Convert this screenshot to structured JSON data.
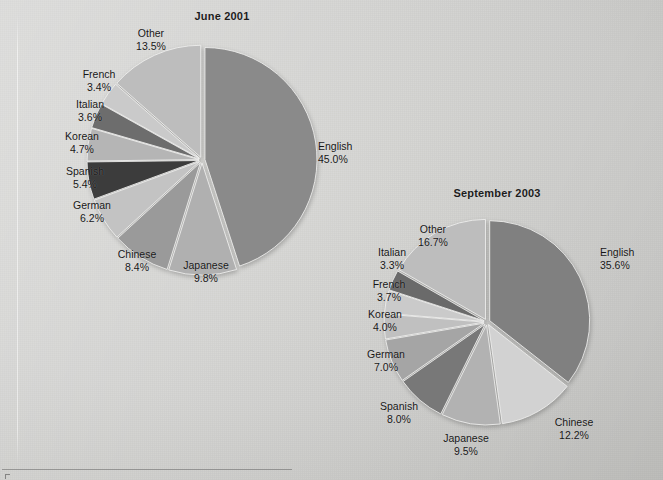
{
  "page": {
    "background_color": "#d0d0ce",
    "artifacts": {
      "fold_line": "vertical-scan-fold",
      "bottom_rule": "horizontal-page-rule"
    }
  },
  "chart_data": [
    {
      "type": "pie",
      "title": "June 2001",
      "categories": [
        "English",
        "Japanese",
        "Chinese",
        "German",
        "Spanish",
        "Korean",
        "Italian",
        "French",
        "Other"
      ],
      "values": [
        45.0,
        9.8,
        8.4,
        6.2,
        5.4,
        4.7,
        3.6,
        3.4,
        13.5
      ],
      "value_labels": [
        "45.0%",
        "9.8%",
        "8.4%",
        "6.2%",
        "5.4%",
        "4.7%",
        "3.6%",
        "3.4%",
        "13.5%"
      ],
      "colors": [
        "#8a8a8a",
        "#b0b0b0",
        "#9a9a9a",
        "#c3c3c3",
        "#3c3c3c",
        "#b5b5b5",
        "#6d6d6d",
        "#cacaca",
        "#bdbdbd"
      ],
      "legend": "inline-labels",
      "start_angle_deg": 0,
      "direction": "clockwise"
    },
    {
      "type": "pie",
      "title": "September 2003",
      "categories": [
        "English",
        "Chinese",
        "Japanese",
        "Spanish",
        "German",
        "Korean",
        "French",
        "Italian",
        "Other"
      ],
      "values": [
        35.6,
        12.2,
        9.5,
        8.0,
        7.0,
        4.0,
        3.7,
        3.3,
        16.7
      ],
      "value_labels": [
        "35.6%",
        "12.2%",
        "9.5%",
        "8.0%",
        "7.0%",
        "4.0%",
        "3.7%",
        "3.3%",
        "16.7%"
      ],
      "colors": [
        "#808080",
        "#d2d2d2",
        "#b2b2b2",
        "#787878",
        "#a5a5a5",
        "#c0c0c0",
        "#cacaca",
        "#6a6a6a",
        "#bdbdbd"
      ],
      "legend": "inline-labels",
      "start_angle_deg": 0,
      "direction": "clockwise"
    }
  ],
  "charts": [
    {
      "id": "june-2001",
      "title": "June 2001",
      "title_pos": {
        "x": 222,
        "y": 10
      },
      "center": {
        "x": 202,
        "y": 160
      },
      "radius": 112,
      "explode": 3,
      "labels": [
        {
          "name": "English",
          "pct": "45.0%",
          "x": 318,
          "y": 152,
          "align": "right"
        },
        {
          "name": "Japanese",
          "pct": "9.8%",
          "x": 206,
          "y": 271,
          "align": "center"
        },
        {
          "name": "Chinese",
          "pct": "8.4%",
          "x": 137,
          "y": 260,
          "align": "center"
        },
        {
          "name": "German",
          "pct": "6.2%",
          "x": 92,
          "y": 211,
          "align": "center"
        },
        {
          "name": "Spanish",
          "pct": "5.4%",
          "x": 85,
          "y": 177,
          "align": "center"
        },
        {
          "name": "Korean",
          "pct": "4.7%",
          "x": 82,
          "y": 142,
          "align": "center"
        },
        {
          "name": "Italian",
          "pct": "3.6%",
          "x": 90,
          "y": 110,
          "align": "center"
        },
        {
          "name": "French",
          "pct": "3.4%",
          "x": 99,
          "y": 80,
          "align": "center"
        },
        {
          "name": "Other",
          "pct": "13.5%",
          "x": 151,
          "y": 39,
          "align": "center"
        }
      ]
    },
    {
      "id": "september-2003",
      "title": "September 2003",
      "title_pos": {
        "x": 497,
        "y": 187
      },
      "center": {
        "x": 487,
        "y": 322
      },
      "radius": 100,
      "explode": 3,
      "labels": [
        {
          "name": "English",
          "pct": "35.6%",
          "x": 600,
          "y": 258,
          "align": "right"
        },
        {
          "name": "Chinese",
          "pct": "12.2%",
          "x": 574,
          "y": 428,
          "align": "center"
        },
        {
          "name": "Japanese",
          "pct": "9.5%",
          "x": 466,
          "y": 444,
          "align": "center"
        },
        {
          "name": "Spanish",
          "pct": "8.0%",
          "x": 399,
          "y": 412,
          "align": "center"
        },
        {
          "name": "German",
          "pct": "7.0%",
          "x": 386,
          "y": 360,
          "align": "center"
        },
        {
          "name": "Korean",
          "pct": "4.0%",
          "x": 385,
          "y": 320,
          "align": "center"
        },
        {
          "name": "French",
          "pct": "3.7%",
          "x": 389,
          "y": 290,
          "align": "center"
        },
        {
          "name": "Italian",
          "pct": "3.3%",
          "x": 392,
          "y": 258,
          "align": "center"
        },
        {
          "name": "Other",
          "pct": "16.7%",
          "x": 433,
          "y": 235,
          "align": "center"
        }
      ]
    }
  ]
}
